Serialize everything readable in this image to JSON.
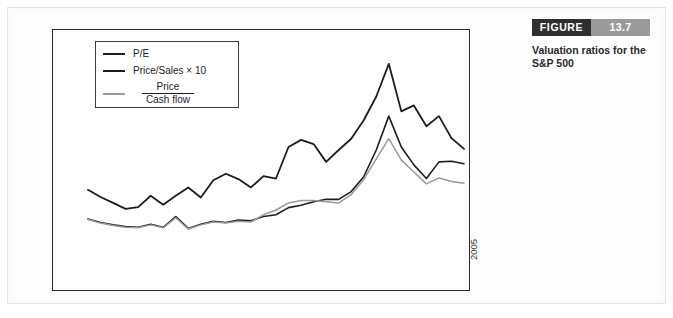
{
  "figure": {
    "badge_label": "FIGURE",
    "badge_number": "13.7",
    "caption": "Valuation ratios for the S&P 500",
    "badge_color": "#2f2f2f",
    "badge_number_color": "#9a9a9a"
  },
  "legend": {
    "items": [
      {
        "label": "P/E",
        "color": "#1d1d1d",
        "fraction": false
      },
      {
        "label": "Price/Sales × 10",
        "color": "#1d1d1d",
        "fraction": false
      },
      {
        "label": "Price / Cash flow",
        "numerator": "Price",
        "denominator": "Cash flow",
        "color": "#9a9a9a",
        "fraction": true
      }
    ]
  },
  "chart_data": {
    "type": "line",
    "title": "Valuation ratios for the S&P 500",
    "xlabel": "",
    "ylabel": "Ratio",
    "ylim": [
      0,
      35
    ],
    "ytick_values": [
      0,
      5,
      10,
      15,
      20,
      25,
      30,
      35
    ],
    "ytick_labels": [
      "0",
      "5",
      "10",
      "15",
      "20",
      "25",
      "30",
      "35"
    ],
    "xlim": [
      1975,
      2005
    ],
    "xtick_values": [
      1975,
      1977,
      1979,
      1981,
      1983,
      1985,
      1987,
      1989,
      1991,
      1993,
      1995,
      1997,
      1999,
      2001,
      2003,
      2005
    ],
    "xtick_labels": [
      "1975",
      "1977",
      "1979",
      "1981",
      "1983",
      "1985",
      "1987",
      "1989",
      "1991",
      "1993",
      "1995",
      "1997",
      "1999",
      "2001",
      "2003",
      "2005"
    ],
    "grid": false,
    "legend_position": "upper-left",
    "x": [
      1975,
      1976,
      1977,
      1978,
      1979,
      1980,
      1981,
      1982,
      1983,
      1984,
      1985,
      1986,
      1987,
      1988,
      1989,
      1990,
      1991,
      1992,
      1993,
      1994,
      1995,
      1996,
      1997,
      1998,
      1999,
      2000,
      2001,
      2002,
      2003,
      2004,
      2005
    ],
    "series": [
      {
        "name": "P/E",
        "color": "#1d1d1d",
        "width": 1.8,
        "values": [
          10.8,
          9.6,
          8.6,
          7.6,
          7.9,
          9.8,
          8.3,
          9.8,
          11.2,
          9.5,
          12.4,
          13.5,
          12.6,
          11.2,
          13.1,
          12.7,
          18.0,
          19.2,
          18.5,
          15.5,
          17.5,
          19.4,
          22.5,
          26.5,
          32.0,
          24.0,
          25.0,
          21.5,
          23.2,
          19.5,
          17.7
        ]
      },
      {
        "name": "Price/Sales × 10",
        "color": "#1d1d1d",
        "width": 1.6,
        "values": [
          5.9,
          5.3,
          4.9,
          4.6,
          4.5,
          5.0,
          4.5,
          6.3,
          4.3,
          5.0,
          5.5,
          5.3,
          5.7,
          5.6,
          6.3,
          6.6,
          7.8,
          8.2,
          8.8,
          9.2,
          9.2,
          10.5,
          13.0,
          17.5,
          23.2,
          18.0,
          15.0,
          12.7,
          15.5,
          15.6,
          15.2
        ]
      },
      {
        "name": "Price / Cash flow",
        "color": "#9a9a9a",
        "width": 1.5,
        "values": [
          5.8,
          5.2,
          4.8,
          4.5,
          4.4,
          4.9,
          4.4,
          6.1,
          4.2,
          4.9,
          5.4,
          5.2,
          5.5,
          5.4,
          6.6,
          7.4,
          8.6,
          9.0,
          9.0,
          8.8,
          8.6,
          10.0,
          12.5,
          16.0,
          19.4,
          15.8,
          13.8,
          11.8,
          12.8,
          12.2,
          11.9
        ]
      }
    ]
  }
}
